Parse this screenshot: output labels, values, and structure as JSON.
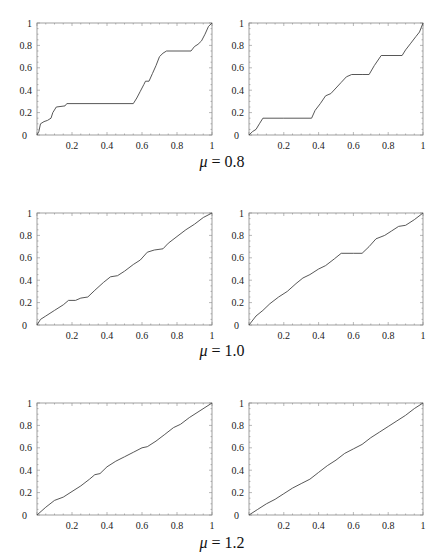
{
  "figure": {
    "rows": [
      {
        "caption_symbol": "μ",
        "caption_value": "= 0.8"
      },
      {
        "caption_symbol": "μ",
        "caption_value": "= 1.0"
      },
      {
        "caption_symbol": "μ",
        "caption_value": "= 1.2"
      }
    ],
    "axis": {
      "x_ticks": [
        "0.2",
        "0.4",
        "0.6",
        "0.8",
        "1"
      ],
      "y_ticks": [
        "0",
        "0.2",
        "0.4",
        "0.6",
        "0.8",
        "1"
      ]
    },
    "line_color": "#444444",
    "frame_color": "#888888"
  },
  "chart_data": [
    {
      "type": "line",
      "title": "μ = 0.8 (left)",
      "xlabel": "",
      "ylabel": "",
      "xlim": [
        0,
        1
      ],
      "ylim": [
        0,
        1
      ],
      "grid": false,
      "x": [
        0,
        0.01,
        0.02,
        0.04,
        0.06,
        0.08,
        0.09,
        0.11,
        0.16,
        0.17,
        0.2,
        0.4,
        0.55,
        0.57,
        0.59,
        0.61,
        0.62,
        0.64,
        0.66,
        0.68,
        0.7,
        0.72,
        0.74,
        0.88,
        0.9,
        0.92,
        0.94,
        0.96,
        0.98,
        1.0
      ],
      "values": [
        0,
        0.03,
        0.1,
        0.12,
        0.13,
        0.15,
        0.2,
        0.25,
        0.26,
        0.28,
        0.28,
        0.28,
        0.28,
        0.33,
        0.39,
        0.45,
        0.48,
        0.48,
        0.55,
        0.62,
        0.7,
        0.73,
        0.75,
        0.75,
        0.79,
        0.81,
        0.84,
        0.9,
        0.97,
        1.0
      ]
    },
    {
      "type": "line",
      "title": "μ = 0.8 (right)",
      "xlabel": "",
      "ylabel": "",
      "xlim": [
        0,
        1
      ],
      "ylim": [
        0,
        1
      ],
      "grid": false,
      "x": [
        0,
        0.02,
        0.04,
        0.06,
        0.08,
        0.2,
        0.36,
        0.38,
        0.41,
        0.44,
        0.47,
        0.5,
        0.53,
        0.56,
        0.59,
        0.65,
        0.69,
        0.72,
        0.76,
        0.88,
        0.9,
        0.93,
        0.96,
        0.98,
        1.0
      ],
      "values": [
        0,
        0.03,
        0.05,
        0.1,
        0.15,
        0.15,
        0.15,
        0.22,
        0.28,
        0.35,
        0.37,
        0.42,
        0.47,
        0.52,
        0.54,
        0.54,
        0.54,
        0.62,
        0.71,
        0.71,
        0.76,
        0.82,
        0.88,
        0.92,
        1.0
      ]
    },
    {
      "type": "line",
      "title": "μ = 1.0 (left)",
      "xlabel": "",
      "ylabel": "",
      "xlim": [
        0,
        1
      ],
      "ylim": [
        0,
        1
      ],
      "grid": false,
      "x": [
        0,
        0.02,
        0.05,
        0.1,
        0.15,
        0.18,
        0.22,
        0.25,
        0.29,
        0.33,
        0.38,
        0.42,
        0.46,
        0.5,
        0.55,
        0.59,
        0.63,
        0.67,
        0.72,
        0.75,
        0.8,
        0.85,
        0.9,
        0.95,
        1.0
      ],
      "values": [
        0,
        0.05,
        0.08,
        0.13,
        0.18,
        0.22,
        0.22,
        0.24,
        0.25,
        0.31,
        0.38,
        0.43,
        0.44,
        0.48,
        0.54,
        0.58,
        0.65,
        0.67,
        0.68,
        0.73,
        0.79,
        0.85,
        0.9,
        0.96,
        1.0
      ]
    },
    {
      "type": "line",
      "title": "μ = 1.0 (right)",
      "xlabel": "",
      "ylabel": "",
      "xlim": [
        0,
        1
      ],
      "ylim": [
        0,
        1
      ],
      "grid": false,
      "x": [
        0,
        0.04,
        0.08,
        0.12,
        0.17,
        0.22,
        0.27,
        0.31,
        0.35,
        0.4,
        0.44,
        0.49,
        0.53,
        0.6,
        0.65,
        0.69,
        0.73,
        0.78,
        0.82,
        0.86,
        0.9,
        0.95,
        1.0
      ],
      "values": [
        0,
        0.08,
        0.13,
        0.19,
        0.25,
        0.3,
        0.37,
        0.42,
        0.45,
        0.5,
        0.53,
        0.59,
        0.64,
        0.64,
        0.64,
        0.7,
        0.77,
        0.8,
        0.84,
        0.88,
        0.89,
        0.94,
        1.0
      ]
    },
    {
      "type": "line",
      "title": "μ = 1.2 (left)",
      "xlabel": "",
      "ylabel": "",
      "xlim": [
        0,
        1
      ],
      "ylim": [
        0,
        1
      ],
      "grid": false,
      "x": [
        0,
        0.05,
        0.1,
        0.15,
        0.2,
        0.25,
        0.3,
        0.33,
        0.36,
        0.4,
        0.45,
        0.5,
        0.55,
        0.6,
        0.63,
        0.68,
        0.73,
        0.78,
        0.82,
        0.87,
        0.92,
        0.96,
        1.0
      ],
      "values": [
        0,
        0.07,
        0.13,
        0.16,
        0.21,
        0.26,
        0.32,
        0.36,
        0.37,
        0.43,
        0.48,
        0.52,
        0.56,
        0.6,
        0.61,
        0.66,
        0.72,
        0.78,
        0.81,
        0.87,
        0.92,
        0.96,
        1.0
      ]
    },
    {
      "type": "line",
      "title": "μ = 1.2 (right)",
      "xlabel": "",
      "ylabel": "",
      "xlim": [
        0,
        1
      ],
      "ylim": [
        0,
        1
      ],
      "grid": false,
      "x": [
        0,
        0.05,
        0.1,
        0.15,
        0.2,
        0.25,
        0.3,
        0.35,
        0.4,
        0.45,
        0.5,
        0.55,
        0.6,
        0.65,
        0.7,
        0.75,
        0.8,
        0.85,
        0.9,
        0.95,
        1.0
      ],
      "values": [
        0,
        0.05,
        0.1,
        0.14,
        0.19,
        0.24,
        0.28,
        0.32,
        0.38,
        0.44,
        0.49,
        0.55,
        0.59,
        0.63,
        0.69,
        0.74,
        0.79,
        0.84,
        0.89,
        0.95,
        1.0
      ]
    }
  ]
}
